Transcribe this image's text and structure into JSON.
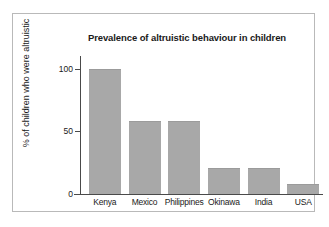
{
  "figure": {
    "background_color": "#ffffff",
    "frame_color": "#b9b9b9",
    "bar_color": "#a8a8a8",
    "axis_color": "#4a4a4a"
  },
  "chart_data": {
    "type": "bar",
    "title": "Prevalence of altruistic behaviour in children",
    "xlabel": "",
    "ylabel": "% of children who were altruistic",
    "categories": [
      "Kenya",
      "Mexico",
      "Philippines",
      "Okinawa",
      "India",
      "USA"
    ],
    "values": [
      100,
      58,
      58,
      21,
      21,
      8
    ],
    "ylim": [
      0,
      110
    ],
    "yticks": [
      0,
      50,
      100
    ],
    "ytick_labels": [
      "0",
      "50",
      "100"
    ],
    "grid": false,
    "legend": null,
    "orientation": "vertical"
  }
}
